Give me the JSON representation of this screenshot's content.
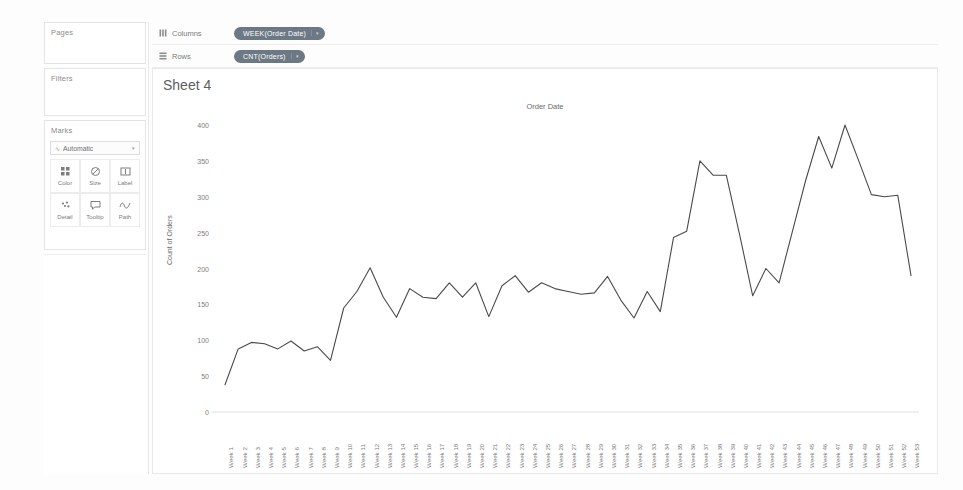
{
  "panel": {
    "pages": {
      "title": "Pages"
    },
    "filters": {
      "title": "Filters"
    },
    "marks": {
      "title": "Marks",
      "mark_type": "Automatic",
      "caret": "▾",
      "buttons": [
        {
          "label": "Color",
          "icon": "color-icon"
        },
        {
          "label": "Size",
          "icon": "size-icon"
        },
        {
          "label": "Label",
          "icon": "label-icon"
        },
        {
          "label": "Detail",
          "icon": "detail-icon"
        },
        {
          "label": "Tooltip",
          "icon": "tooltip-icon"
        },
        {
          "label": "Path",
          "icon": "path-icon"
        }
      ]
    }
  },
  "shelves": [
    {
      "name": "Columns",
      "pill": "WEEK(Order Date)",
      "caret": "▾"
    },
    {
      "name": "Rows",
      "pill": "CNT(Orders)",
      "caret": "▾"
    }
  ],
  "view": {
    "sheet_title": "Sheet 4"
  },
  "chart_data": {
    "type": "line",
    "title": "Order Date",
    "xlabel": "",
    "ylabel": "Count of Orders",
    "ylim": [
      0,
      400
    ],
    "ytick_step": 50,
    "yticks": [
      0,
      50,
      100,
      150,
      200,
      250,
      300,
      350,
      400
    ],
    "grid": false,
    "legend": "none",
    "line_color": "#4a4a4a",
    "categories": [
      "Week 1",
      "Week 2",
      "Week 3",
      "Week 4",
      "Week 5",
      "Week 6",
      "Week 7",
      "Week 8",
      "Week 9",
      "Week 10",
      "Week 11",
      "Week 12",
      "Week 13",
      "Week 14",
      "Week 15",
      "Week 16",
      "Week 17",
      "Week 18",
      "Week 19",
      "Week 20",
      "Week 21",
      "Week 22",
      "Week 23",
      "Week 24",
      "Week 25",
      "Week 26",
      "Week 27",
      "Week 28",
      "Week 29",
      "Week 30",
      "Week 31",
      "Week 32",
      "Week 33",
      "Week 34",
      "Week 35",
      "Week 36",
      "Week 37",
      "Week 38",
      "Week 39",
      "Week 40",
      "Week 41",
      "Week 42",
      "Week 43",
      "Week 44",
      "Week 45",
      "Week 46",
      "Week 47",
      "Week 48",
      "Week 49",
      "Week 50",
      "Week 51",
      "Week 52",
      "Week 53"
    ],
    "values": [
      38,
      88,
      97,
      95,
      88,
      99,
      85,
      91,
      72,
      145,
      168,
      201,
      160,
      132,
      172,
      160,
      158,
      180,
      160,
      180,
      133,
      176,
      190,
      167,
      180,
      172,
      168,
      164,
      166,
      189,
      156,
      131,
      168,
      140,
      243,
      252,
      350,
      330,
      330,
      248,
      162,
      200,
      180,
      251,
      322,
      384,
      340,
      400,
      352,
      303,
      300,
      302,
      190
    ]
  }
}
